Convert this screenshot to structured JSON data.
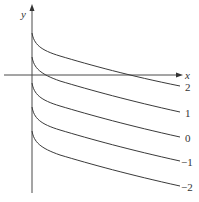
{
  "axes": {
    "x_label": "x",
    "y_label": "y"
  },
  "curves": [
    {
      "label": "2",
      "start_y": 33,
      "end_y": 86
    },
    {
      "label": "1",
      "start_y": 57,
      "end_y": 112
    },
    {
      "label": "0",
      "start_y": 83,
      "end_y": 137
    },
    {
      "label": "−1",
      "start_y": 107,
      "end_y": 161
    },
    {
      "label": "−2",
      "start_y": 131,
      "end_y": 186
    }
  ]
}
